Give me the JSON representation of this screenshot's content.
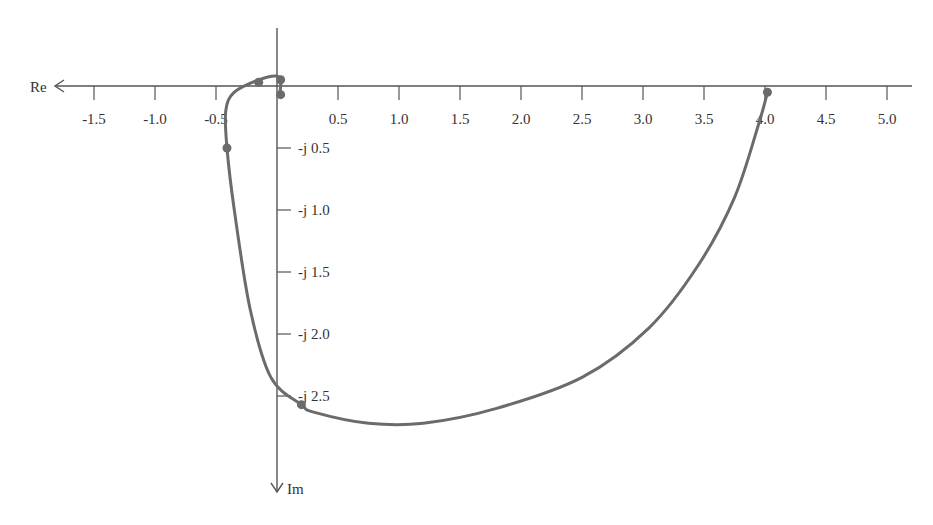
{
  "chart_data": {
    "type": "line",
    "subtype": "nyquist-polar-plot",
    "title": "",
    "xlabel": "Re",
    "ylabel": "Im",
    "x_axis_direction_arrow": "left",
    "y_axis_direction_arrow": "down",
    "grid": false,
    "legend": null,
    "xlim": [
      -1.8,
      5.8
    ],
    "ylim": [
      -3.1,
      0.35
    ],
    "x_ticks": [
      -1.5,
      -1.0,
      -0.5,
      0.5,
      1.0,
      1.5,
      2.0,
      2.5,
      3.0,
      3.5,
      4.0,
      4.5,
      5.0
    ],
    "x_tick_labels": [
      "-1.5",
      "-1.0",
      "-0.5",
      "0.5",
      "1.0",
      "1.5",
      "2.0",
      "2.5",
      "3.0",
      "3.5",
      "4.0",
      "4.5",
      "5.0"
    ],
    "y_ticks": [
      -0.5,
      -1.0,
      -1.5,
      -2.0,
      -2.5
    ],
    "y_tick_labels": [
      "-j 0.5",
      "-j 1.0",
      "-j 1.5",
      "-j 2.0",
      "-j 2.5"
    ],
    "series": [
      {
        "name": "G(jω) locus",
        "color": "#6b6b6b",
        "points": [
          {
            "re": 4.02,
            "im": -0.05
          },
          {
            "re": 3.95,
            "im": -0.3
          },
          {
            "re": 3.75,
            "im": -0.9
          },
          {
            "re": 3.45,
            "im": -1.45
          },
          {
            "re": 3.05,
            "im": -1.95
          },
          {
            "re": 2.5,
            "im": -2.35
          },
          {
            "re": 1.8,
            "im": -2.6
          },
          {
            "re": 1.2,
            "im": -2.72
          },
          {
            "re": 0.75,
            "im": -2.72
          },
          {
            "re": 0.3,
            "im": -2.63
          },
          {
            "re": 0.2,
            "im": -2.57
          },
          {
            "re": -0.05,
            "im": -2.35
          },
          {
            "re": -0.22,
            "im": -1.8
          },
          {
            "re": -0.35,
            "im": -1.0
          },
          {
            "re": -0.41,
            "im": -0.5
          },
          {
            "re": -0.42,
            "im": -0.2
          },
          {
            "re": -0.35,
            "im": -0.05
          },
          {
            "re": -0.15,
            "im": 0.05
          },
          {
            "re": 0.0,
            "im": 0.08
          },
          {
            "re": 0.03,
            "im": 0.02
          },
          {
            "re": 0.02,
            "im": -0.08
          }
        ],
        "markers": [
          {
            "re": 4.02,
            "im": -0.05
          },
          {
            "re": 0.2,
            "im": -2.57
          },
          {
            "re": -0.41,
            "im": -0.5
          },
          {
            "re": -0.15,
            "im": 0.03
          },
          {
            "re": 0.03,
            "im": 0.05
          },
          {
            "re": 0.03,
            "im": -0.07
          }
        ]
      }
    ]
  }
}
